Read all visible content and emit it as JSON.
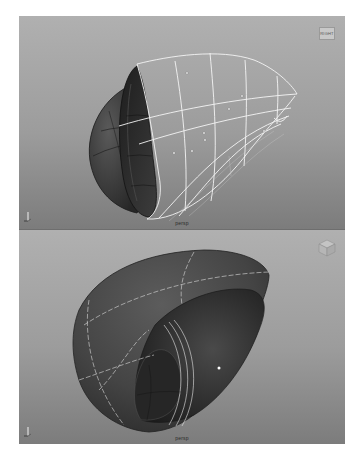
{
  "viewports": [
    {
      "id": "top",
      "camera_label": "persp",
      "viewcube_face": "RIGHT",
      "view_mode": "wireframe-on-shaded",
      "background_gradient": [
        "#b0b0b0",
        "#7c7c7c"
      ]
    },
    {
      "id": "bottom",
      "camera_label": "persp",
      "viewcube_face": "",
      "view_mode": "shaded",
      "background_gradient": [
        "#b0b0b0",
        "#7c7c7c"
      ]
    }
  ],
  "icons": {
    "axis_gizmo": "axis-triad-icon",
    "viewcube": "view-cube-icon"
  },
  "colors": {
    "surface_dark": "#3a3a3a",
    "surface_mid": "#555555",
    "wireframe": "#f2f2f2",
    "isoparm": "#d8d8d8"
  }
}
